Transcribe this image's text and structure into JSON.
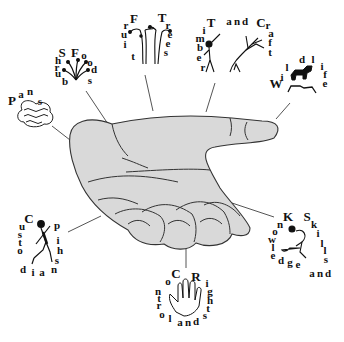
{
  "diagram": {
    "title": "",
    "center": {
      "label": "Open hand (palm up)",
      "fill": "#d9d9d9",
      "stroke": "#333333"
    },
    "nodes": [
      {
        "id": "pans",
        "label": "Pans",
        "letters": [
          {
            "c": "P",
            "x": 12,
            "y": 100,
            "big": true
          },
          {
            "c": "a",
            "x": 21,
            "y": 94
          },
          {
            "c": "n",
            "x": 30,
            "y": 91
          },
          {
            "c": "s",
            "x": 40,
            "y": 101
          }
        ],
        "icon": "cloud-water-icon"
      },
      {
        "id": "shrub-foods",
        "label": "Shrub Foods",
        "letters": [
          {
            "c": "S",
            "x": 62,
            "y": 52,
            "big": true
          },
          {
            "c": "h",
            "x": 58,
            "y": 60
          },
          {
            "c": "r",
            "x": 57,
            "y": 67
          },
          {
            "c": "u",
            "x": 58,
            "y": 73
          },
          {
            "c": "b",
            "x": 65,
            "y": 81
          },
          {
            "c": "F",
            "x": 75,
            "y": 52,
            "big": true
          },
          {
            "c": "o",
            "x": 84,
            "y": 55
          },
          {
            "c": "o",
            "x": 90,
            "y": 62
          },
          {
            "c": "d",
            "x": 94,
            "y": 69
          },
          {
            "c": "s",
            "x": 90,
            "y": 80
          }
        ],
        "icon": "shrub-icon"
      },
      {
        "id": "fruit-trees",
        "label": "Fruit Trees",
        "letters": [
          {
            "c": "F",
            "x": 134,
            "y": 18,
            "big": true
          },
          {
            "c": "r",
            "x": 126,
            "y": 25
          },
          {
            "c": "u",
            "x": 124,
            "y": 34
          },
          {
            "c": "i",
            "x": 125,
            "y": 44
          },
          {
            "c": "t",
            "x": 133,
            "y": 56
          },
          {
            "c": "T",
            "x": 162,
            "y": 17,
            "big": true
          },
          {
            "c": "r",
            "x": 168,
            "y": 25
          },
          {
            "c": "e",
            "x": 170,
            "y": 34
          },
          {
            "c": "e",
            "x": 168,
            "y": 43
          },
          {
            "c": "s",
            "x": 166,
            "y": 52
          }
        ],
        "icon": "fruit-trees-icon"
      },
      {
        "id": "timber-and-craft",
        "label": "Timber and Craft",
        "letters": [
          {
            "c": "T",
            "x": 211,
            "y": 22,
            "big": true
          },
          {
            "c": "i",
            "x": 204,
            "y": 30
          },
          {
            "c": "m",
            "x": 200,
            "y": 38
          },
          {
            "c": "b",
            "x": 200,
            "y": 47
          },
          {
            "c": "e",
            "x": 199,
            "y": 57
          },
          {
            "c": "r",
            "x": 203,
            "y": 67
          },
          {
            "c": "a",
            "x": 229,
            "y": 21
          },
          {
            "c": "n",
            "x": 237,
            "y": 21
          },
          {
            "c": "d",
            "x": 245,
            "y": 21
          },
          {
            "c": "C",
            "x": 261,
            "y": 22,
            "big": true
          },
          {
            "c": "r",
            "x": 268,
            "y": 25
          },
          {
            "c": "a",
            "x": 271,
            "y": 33
          },
          {
            "c": "f",
            "x": 270,
            "y": 42
          },
          {
            "c": "t",
            "x": 270,
            "y": 52
          }
        ],
        "icon": "person-tree-icon"
      },
      {
        "id": "wildlife",
        "label": "Wildlife",
        "letters": [
          {
            "c": "W",
            "x": 276,
            "y": 83,
            "big": true
          },
          {
            "c": "i",
            "x": 282,
            "y": 77
          },
          {
            "c": "l",
            "x": 287,
            "y": 67
          },
          {
            "c": "d",
            "x": 302,
            "y": 59
          },
          {
            "c": "l",
            "x": 313,
            "y": 59
          },
          {
            "c": "i",
            "x": 322,
            "y": 66
          },
          {
            "c": "f",
            "x": 325,
            "y": 74
          },
          {
            "c": "e",
            "x": 325,
            "y": 83
          }
        ],
        "icon": "animals-icon"
      },
      {
        "id": "custodianship",
        "label": "Custodianship",
        "letters": [
          {
            "c": "C",
            "x": 29,
            "y": 218,
            "big": true
          },
          {
            "c": "u",
            "x": 22,
            "y": 226
          },
          {
            "c": "s",
            "x": 20,
            "y": 234
          },
          {
            "c": "t",
            "x": 20,
            "y": 242
          },
          {
            "c": "o",
            "x": 20,
            "y": 250
          },
          {
            "c": "d",
            "x": 23,
            "y": 269
          },
          {
            "c": "i",
            "x": 33,
            "y": 272
          },
          {
            "c": "a",
            "x": 42,
            "y": 272
          },
          {
            "c": "n",
            "x": 54,
            "y": 269
          },
          {
            "c": "s",
            "x": 57,
            "y": 260
          },
          {
            "c": "h",
            "x": 60,
            "y": 250
          },
          {
            "c": "i",
            "x": 58,
            "y": 240
          },
          {
            "c": "p",
            "x": 57,
            "y": 225
          }
        ],
        "icon": "custodian-person-icon"
      },
      {
        "id": "control-and-rights",
        "label": "Control and Rights",
        "letters": [
          {
            "c": "C",
            "x": 176,
            "y": 273,
            "big": true
          },
          {
            "c": "o",
            "x": 168,
            "y": 281
          },
          {
            "c": "n",
            "x": 158,
            "y": 291
          },
          {
            "c": "t",
            "x": 159,
            "y": 298
          },
          {
            "c": "r",
            "x": 159,
            "y": 305
          },
          {
            "c": "o",
            "x": 162,
            "y": 314
          },
          {
            "c": "l",
            "x": 170,
            "y": 318
          },
          {
            "c": "a",
            "x": 180,
            "y": 322
          },
          {
            "c": "n",
            "x": 188,
            "y": 322
          },
          {
            "c": "d",
            "x": 196,
            "y": 321
          },
          {
            "c": "s",
            "x": 205,
            "y": 315
          },
          {
            "c": "t",
            "x": 208,
            "y": 308
          },
          {
            "c": "h",
            "x": 210,
            "y": 300
          },
          {
            "c": "g",
            "x": 210,
            "y": 291
          },
          {
            "c": "i",
            "x": 207,
            "y": 283
          },
          {
            "c": "R",
            "x": 196,
            "y": 276,
            "big": true
          }
        ],
        "icon": "hand-icon"
      },
      {
        "id": "knowledge-and-skills",
        "label": "Knowledge and Skills",
        "letters": [
          {
            "c": "K",
            "x": 288,
            "y": 216,
            "big": true
          },
          {
            "c": "n",
            "x": 280,
            "y": 224
          },
          {
            "c": "o",
            "x": 275,
            "y": 231
          },
          {
            "c": "w",
            "x": 272,
            "y": 239
          },
          {
            "c": "l",
            "x": 273,
            "y": 247
          },
          {
            "c": "e",
            "x": 273,
            "y": 255
          },
          {
            "c": "d",
            "x": 281,
            "y": 260
          },
          {
            "c": "g",
            "x": 290,
            "y": 262
          },
          {
            "c": "e",
            "x": 298,
            "y": 264
          },
          {
            "c": "a",
            "x": 312,
            "y": 273
          },
          {
            "c": "n",
            "x": 320,
            "y": 273
          },
          {
            "c": "d",
            "x": 328,
            "y": 273
          },
          {
            "c": "S",
            "x": 307,
            "y": 216,
            "big": true
          },
          {
            "c": "k",
            "x": 314,
            "y": 224
          },
          {
            "c": "i",
            "x": 318,
            "y": 233
          },
          {
            "c": "l",
            "x": 322,
            "y": 243
          },
          {
            "c": "l",
            "x": 325,
            "y": 250
          },
          {
            "c": "s",
            "x": 326,
            "y": 259
          }
        ],
        "icon": "person-weaving-icon"
      }
    ]
  }
}
